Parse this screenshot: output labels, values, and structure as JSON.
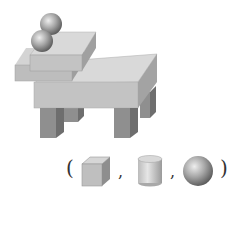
{
  "figure": {
    "components": [
      "two spheres",
      "upper slab",
      "lower slab",
      "table top",
      "four legs"
    ]
  },
  "answer_choices": {
    "open_paren": "(",
    "close_paren": ")",
    "separator": ",",
    "items": [
      {
        "shape": "cube",
        "icon": "cube-icon"
      },
      {
        "shape": "cylinder",
        "icon": "cylinder-icon"
      },
      {
        "shape": "sphere",
        "icon": "sphere-icon"
      }
    ]
  },
  "colors": {
    "top_face": "#d9d9d9",
    "front_face": "#bdbdbd",
    "side_face": "#999999",
    "leg_front": "#8f8f8f",
    "leg_side": "#6e6e6e",
    "sphere_light": "#e0e0e0",
    "sphere_dark": "#555555"
  }
}
